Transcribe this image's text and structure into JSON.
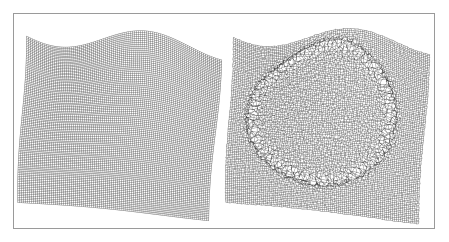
{
  "figure": {
    "title": "Deformed computational mesh comparison",
    "caption": "",
    "background_color": "#ffffff",
    "frame": {
      "border_color": "#9a9a9a",
      "border_width_px": 1,
      "x": 13,
      "y": 13,
      "width": 422,
      "height": 216
    },
    "mesh_line_color": "#2b2b2b",
    "panel_gap_px": 8
  },
  "panels": [
    {
      "id": "left",
      "label": "Undisturbed deformed mesh",
      "grid_cols": 96,
      "grid_rows": 96,
      "noise_amplitude": 0.0,
      "line_alpha": 0.62,
      "feature": "none",
      "corners": {
        "top_left": [
          0.055,
          0.075
        ],
        "top_right": [
          0.985,
          0.175
        ],
        "bottom_right": [
          0.93,
          0.96
        ],
        "bottom_left": [
          0.02,
          0.88
        ]
      },
      "wave": {
        "amplitude": 0.05,
        "frequency": 1.15,
        "phase": 0.35
      }
    },
    {
      "id": "right",
      "label": "Perturbed mesh with circular inclusion",
      "grid_cols": 96,
      "grid_rows": 96,
      "noise_amplitude": 0.34,
      "line_alpha": 0.62,
      "feature": "ring",
      "corners": {
        "top_left": [
          0.04,
          0.08
        ],
        "top_right": [
          0.975,
          0.15
        ],
        "bottom_right": [
          0.93,
          0.975
        ],
        "bottom_left": [
          0.01,
          0.88
        ]
      },
      "wave": {
        "amplitude": 0.048,
        "frequency": 1.15,
        "phase": 0.4
      },
      "ring": {
        "center_x": 0.47,
        "center_y": 0.45,
        "radius_x": 0.36,
        "radius_y": 0.38,
        "thickness": 0.055,
        "strength": 1.0
      }
    }
  ]
}
